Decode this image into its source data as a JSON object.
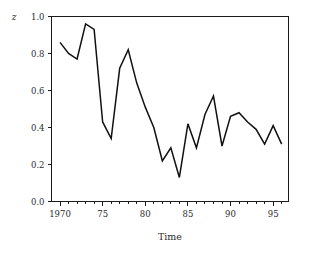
{
  "chart_data": {
    "type": "line",
    "title": "",
    "xlabel": "Time",
    "ylabel": "z",
    "xlim": [
      1969.0,
      1996.8
    ],
    "ylim": [
      0.0,
      1.0
    ],
    "grid": false,
    "legend": null,
    "x": [
      1970,
      1971,
      1972,
      1973,
      1974,
      1975,
      1976,
      1977,
      1978,
      1979,
      1980,
      1981,
      1982,
      1983,
      1984,
      1985,
      1986,
      1987,
      1988,
      1989,
      1990,
      1991,
      1992,
      1993,
      1994,
      1995,
      1996
    ],
    "values": [
      0.86,
      0.8,
      0.77,
      0.96,
      0.93,
      0.43,
      0.34,
      0.72,
      0.82,
      0.64,
      0.51,
      0.4,
      0.22,
      0.29,
      0.13,
      0.42,
      0.29,
      0.47,
      0.57,
      0.3,
      0.46,
      0.48,
      0.43,
      0.39,
      0.31,
      0.41,
      0.31
    ],
    "series": [
      {
        "name": "z",
        "values": [
          0.86,
          0.8,
          0.77,
          0.96,
          0.93,
          0.43,
          0.34,
          0.72,
          0.82,
          0.64,
          0.51,
          0.4,
          0.22,
          0.29,
          0.13,
          0.42,
          0.29,
          0.47,
          0.57,
          0.3,
          0.46,
          0.48,
          0.43,
          0.39,
          0.31,
          0.41,
          0.31
        ],
        "color": "#111111"
      }
    ],
    "x_tick_labels": [
      "1970",
      "75",
      "80",
      "85",
      "90",
      "95"
    ],
    "x_tick_values": [
      1970,
      1975,
      1980,
      1985,
      1990,
      1995
    ],
    "x_minor_tick_values": [
      1970,
      1971,
      1972,
      1973,
      1974,
      1975,
      1976,
      1977,
      1978,
      1979,
      1980,
      1981,
      1982,
      1983,
      1984,
      1985,
      1986,
      1987,
      1988,
      1989,
      1990,
      1991,
      1992,
      1993,
      1994,
      1995,
      1996
    ],
    "y_tick_labels": [
      "0.0",
      "0.2",
      "0.4",
      "0.6",
      "0.8",
      "1.0"
    ],
    "y_tick_values": [
      0.0,
      0.2,
      0.4,
      0.6,
      0.8,
      1.0
    ],
    "line_color": "#111111",
    "axis_color": "#1a1a1a",
    "background_color": "#ffffff"
  }
}
